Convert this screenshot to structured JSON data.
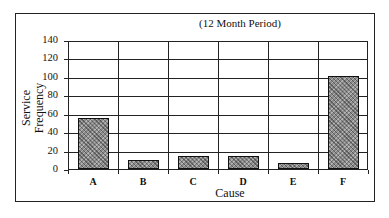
{
  "chart_data": {
    "type": "bar",
    "title": "(12 Month Period)",
    "xlabel": "Cause",
    "ylabel": "Service Frequency",
    "categories": [
      "A",
      "B",
      "C",
      "D",
      "E",
      "F"
    ],
    "values": [
      55,
      10,
      14,
      14,
      7,
      101
    ],
    "ylim": [
      0,
      140
    ],
    "yticks": [
      0,
      20,
      40,
      60,
      80,
      100,
      120,
      140
    ],
    "grid": true,
    "legend": null
  },
  "labels": {
    "subtitle": "(12 Month Period)",
    "xtitle": "Cause",
    "ytitle_line1": "Service",
    "ytitle_line2": "Frequency"
  }
}
